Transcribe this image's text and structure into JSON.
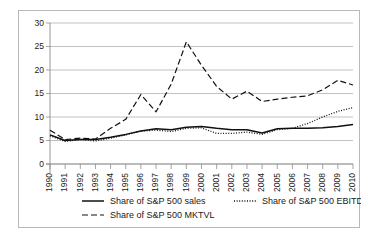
{
  "chart_data": {
    "type": "line",
    "title": "",
    "subtitle": "",
    "xlabel": "",
    "ylabel": "",
    "xlim": [
      1990,
      2010
    ],
    "ylim": [
      0,
      30
    ],
    "yticks": [
      0,
      5,
      10,
      15,
      20,
      25,
      30
    ],
    "ytick_labels": [
      "0",
      "5",
      "10",
      "15",
      "20",
      "25",
      "30"
    ],
    "grid": "horizontal",
    "legend_position": "bottom",
    "categories": [
      "1990",
      "1991",
      "1992",
      "1993",
      "1994",
      "1995",
      "1996",
      "1997",
      "1998",
      "1999",
      "2000",
      "2001",
      "2002",
      "2003",
      "2004",
      "2005",
      "2006",
      "2007",
      "2008",
      "2009",
      "2010"
    ],
    "series": [
      {
        "name": "Share of S&P 500 sales",
        "style": "solid",
        "color": "#111111",
        "values": [
          6.2,
          5.0,
          5.2,
          5.2,
          5.7,
          6.3,
          7.0,
          7.5,
          7.3,
          7.8,
          8.0,
          7.6,
          7.3,
          7.3,
          6.6,
          7.5,
          7.6,
          7.6,
          7.7,
          8.0,
          8.4
        ]
      },
      {
        "name": "Share of S&P 500 EBITDA",
        "style": "dotted",
        "color": "#111111",
        "values": [
          6.0,
          4.8,
          5.2,
          4.9,
          5.5,
          6.2,
          7.0,
          7.2,
          6.9,
          7.6,
          7.7,
          6.5,
          6.5,
          6.8,
          6.3,
          7.3,
          7.6,
          8.6,
          10.0,
          11.2,
          12.0
        ]
      },
      {
        "name": "Share of S&P 500 MKTVL",
        "style": "dashed",
        "color": "#111111",
        "values": [
          7.2,
          5.2,
          5.5,
          5.3,
          7.6,
          9.5,
          14.8,
          11.1,
          17.0,
          26.0,
          21.0,
          16.5,
          13.8,
          15.5,
          13.3,
          13.8,
          14.2,
          14.5,
          15.8,
          17.8,
          16.8
        ]
      }
    ],
    "legend": [
      {
        "label": "Share of S&P 500 sales",
        "style": "solid"
      },
      {
        "label": "Share of S&P 500 EBITDA",
        "style": "dotted"
      },
      {
        "label": "Share of S&P 500 MKTVL",
        "style": "dashed"
      }
    ]
  }
}
